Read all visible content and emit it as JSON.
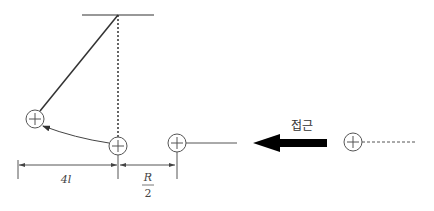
{
  "diagram": {
    "title": "",
    "colors": {
      "line": "#333333",
      "thin_line": "#555555",
      "arrow": "#000000",
      "charge_stroke": "#555555"
    },
    "labels": {
      "approach": "접근",
      "distance_left": "4l",
      "distance_right_numerator": "R",
      "distance_right_denominator": "2"
    },
    "charges": [
      {
        "name": "deflected-charge",
        "sign": "+",
        "cx": 35,
        "cy": 119
      },
      {
        "name": "hanging-charge",
        "sign": "+",
        "cx": 118,
        "cy": 146
      },
      {
        "name": "fixed-charge",
        "sign": "+",
        "cx": 177,
        "cy": 143
      },
      {
        "name": "approaching-charge",
        "sign": "+",
        "cx": 353,
        "cy": 142
      }
    ],
    "elements": {
      "ceiling": "horizontal support line",
      "string": "pendulum string at an angle",
      "vertical_reference": "dotted vertical line",
      "deflection_path": "curved arrow from hanging to deflected position",
      "approach_arrow": "thick leftward arrow"
    }
  }
}
